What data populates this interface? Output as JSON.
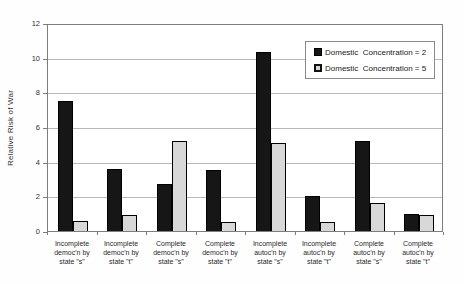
{
  "chart_data": {
    "type": "bar",
    "title": "",
    "xlabel": "",
    "ylabel": "Relative Risk of War",
    "ylim": [
      0,
      12
    ],
    "yticks": [
      0,
      2,
      4,
      6,
      8,
      10,
      12
    ],
    "grid": "horizontal",
    "legend_position": "top-right",
    "categories": [
      [
        "Incomplete",
        "democ'n by",
        "state \"s\""
      ],
      [
        "Incomplete",
        "democ'n by",
        "state \"t\""
      ],
      [
        "Complete",
        "democ'n by",
        "state \"s\""
      ],
      [
        "Complete",
        "democ'n by",
        "state \"t\""
      ],
      [
        "Incomplete",
        "autoc'n by",
        "state \"s\""
      ],
      [
        "Incomplete",
        "autoc'n by",
        "state \"t\""
      ],
      [
        "Complete",
        "autoc'n by",
        "state \"s\""
      ],
      [
        "Complete",
        "autoc'n by",
        "state \"t\""
      ]
    ],
    "series": [
      {
        "name": "Domestic  Concentration = 2",
        "color": "#161616",
        "values": [
          7.5,
          3.6,
          2.7,
          3.5,
          10.3,
          2.0,
          5.2,
          1.0
        ]
      },
      {
        "name": "Domestic  Concentration = 5",
        "color": "#d8d8d8",
        "values": [
          0.6,
          0.9,
          5.2,
          0.5,
          5.1,
          0.5,
          1.6,
          0.9
        ]
      }
    ]
  }
}
